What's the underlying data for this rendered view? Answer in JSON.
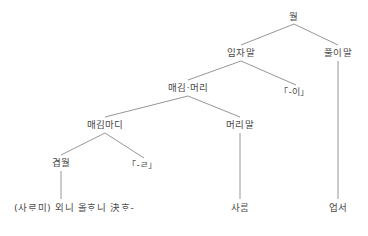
{
  "diagram": {
    "line_color": "#8a8a8a",
    "text_color": "#4a4a4a",
    "background": "#ffffff",
    "nodes": [
      {
        "id": "root",
        "label": "월",
        "x": 294,
        "y": 17
      },
      {
        "id": "subject",
        "label": "임자말",
        "x": 241,
        "y": 53
      },
      {
        "id": "predicate",
        "label": "풀이말",
        "x": 338,
        "y": 53
      },
      {
        "id": "modhead",
        "label": "매김·머리",
        "x": 188,
        "y": 88
      },
      {
        "id": "part-i",
        "label": "「-이」",
        "x": 294,
        "y": 92
      },
      {
        "id": "modclause",
        "label": "매김마디",
        "x": 105,
        "y": 125
      },
      {
        "id": "headword",
        "label": "머리말",
        "x": 240,
        "y": 125
      },
      {
        "id": "complexsent",
        "label": "겹월",
        "x": 61,
        "y": 163
      },
      {
        "id": "part-l",
        "label": "「-ㄹ」",
        "x": 142,
        "y": 165
      },
      {
        "id": "saram",
        "label": "사ᄅᆞᆷ",
        "x": 240,
        "y": 208
      },
      {
        "id": "eopseo",
        "label": "업서",
        "x": 338,
        "y": 208
      }
    ],
    "terminal_phrase": {
      "id": "bottom-string",
      "label": "(사ᄅᆞ미) 외니 올ᄒᆞ니 決ᄒᆞ-",
      "x": 14,
      "y": 208
    },
    "edges": [
      {
        "id": "root-subject",
        "from": "root",
        "to": "subject",
        "x1": 294,
        "y1": 24,
        "x2": 241,
        "y2": 45
      },
      {
        "id": "root-predicate",
        "from": "root",
        "to": "predicate",
        "x1": 294,
        "y1": 24,
        "x2": 338,
        "y2": 45
      },
      {
        "id": "subject-modhead",
        "from": "subject",
        "to": "modhead",
        "x1": 241,
        "y1": 61,
        "x2": 188,
        "y2": 80
      },
      {
        "id": "subject-parti",
        "from": "subject",
        "to": "part-i",
        "x1": 241,
        "y1": 61,
        "x2": 296,
        "y2": 85
      },
      {
        "id": "modhead-modclause",
        "from": "modhead",
        "to": "modclause",
        "x1": 188,
        "y1": 96,
        "x2": 105,
        "y2": 117
      },
      {
        "id": "modhead-headword",
        "from": "modhead",
        "to": "headword",
        "x1": 188,
        "y1": 96,
        "x2": 240,
        "y2": 117
      },
      {
        "id": "modclause-complex",
        "from": "modclause",
        "to": "complexsent",
        "x1": 105,
        "y1": 133,
        "x2": 61,
        "y2": 155
      },
      {
        "id": "modclause-partl",
        "from": "modclause",
        "to": "part-l",
        "x1": 105,
        "y1": 133,
        "x2": 144,
        "y2": 158
      },
      {
        "id": "complex-bottom",
        "from": "complexsent",
        "to": "bottom",
        "x1": 61,
        "y1": 171,
        "x2": 61,
        "y2": 199
      },
      {
        "id": "headword-saram",
        "from": "headword",
        "to": "saram",
        "x1": 240,
        "y1": 133,
        "x2": 240,
        "y2": 199
      },
      {
        "id": "predicate-eopseo",
        "from": "predicate",
        "to": "eopseo",
        "x1": 338,
        "y1": 61,
        "x2": 338,
        "y2": 199
      }
    ]
  }
}
